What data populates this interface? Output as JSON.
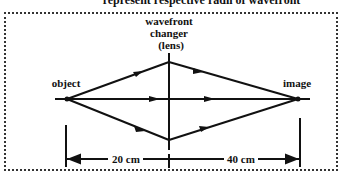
{
  "caption": "represent respective radii of wavefront",
  "labels": {
    "lens_line1": "wavefront",
    "lens_line2": "changer",
    "lens_line3": "(lens)",
    "object": "object",
    "image": "image",
    "left_distance": "20 cm",
    "right_distance": "40 cm"
  },
  "colors": {
    "ink": "#111111",
    "border": "#333333",
    "background": "#ffffff"
  }
}
